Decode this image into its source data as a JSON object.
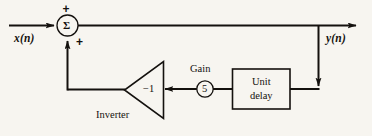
{
  "diagram": {
    "background_color": "#f7f5f0",
    "line_color": "#14110e",
    "input": {
      "label": "x(n)"
    },
    "output": {
      "label": "y(n)"
    },
    "summer": {
      "symbol": "Σ",
      "sign_top": "+",
      "sign_bottom": "+"
    },
    "inverter": {
      "label": "Inverter",
      "value": "−1"
    },
    "gain": {
      "label": "Gain",
      "value": "5"
    },
    "delay": {
      "line1": "Unit",
      "line2": "delay"
    }
  }
}
